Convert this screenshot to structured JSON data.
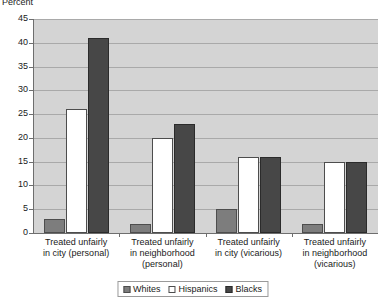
{
  "chart_data": {
    "type": "bar",
    "title": "",
    "xlabel": "",
    "ylabel": "Percent",
    "ylim": [
      0,
      45
    ],
    "ytick_step": 5,
    "yticks": [
      45,
      40,
      35,
      30,
      25,
      20,
      15,
      10,
      5,
      0
    ],
    "grid": true,
    "legend_position": "bottom-center",
    "categories": [
      "Treated unfairly in city (personal)",
      "Treated unfairly in neighborhood (personal)",
      "Treated unfairly in city (vicarious)",
      "Treated unfairly in neighborhood (vicarious)"
    ],
    "category_lines": [
      [
        "Treated unfairly",
        "in city (personal)"
      ],
      [
        "Treated unfairly",
        "in neighborhood",
        "(personal)"
      ],
      [
        "Treated unfairly",
        "in city (vicarious)"
      ],
      [
        "Treated unfairly",
        "in neighborhood",
        "(vicarious)"
      ]
    ],
    "series": [
      {
        "name": "Whites",
        "color": "#7d7d7d",
        "values": [
          3,
          2,
          5,
          2
        ]
      },
      {
        "name": "Hispanics",
        "color": "#ffffff",
        "values": [
          26,
          20,
          16,
          15
        ]
      },
      {
        "name": "Blacks",
        "color": "#474747",
        "values": [
          41,
          23,
          16,
          15
        ]
      }
    ],
    "plot_background": "#d4d4d4",
    "gridline_color": "#a9a9a9",
    "axis_color": "#6e6e6e"
  }
}
